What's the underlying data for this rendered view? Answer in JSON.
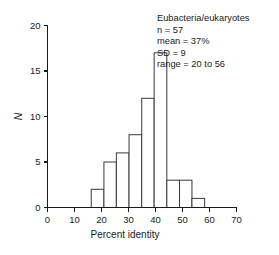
{
  "chart_data": {
    "type": "bar",
    "title": "",
    "subtitle": "",
    "xlabel": "Percent identity",
    "ylabel": "N",
    "xlim": [
      0,
      70
    ],
    "ylim": [
      0,
      20
    ],
    "xticks": [
      0,
      10,
      20,
      30,
      40,
      50,
      60,
      70
    ],
    "yticks": [
      0,
      5,
      10,
      15,
      20
    ],
    "grid": false,
    "legend": null,
    "bin_edges": [
      16.2,
      20.9,
      25.5,
      30.2,
      34.9,
      39.5,
      44.2,
      48.9,
      53.5,
      58.2
    ],
    "bin_width": 4.67,
    "categories": [
      "16-21",
      "21-26",
      "26-30",
      "30-35",
      "35-40",
      "40-44",
      "44-49",
      "49-54",
      "54-58"
    ],
    "values": [
      2,
      5,
      6,
      8,
      12,
      17,
      3,
      3,
      1
    ],
    "bar_style": {
      "fill": "#ffffff",
      "edge": "#3a3a3a"
    },
    "annotations": [
      "Eubacteria/eukaryotes",
      "n = 57",
      "mean = 37%",
      "SD = 9",
      "range = 20 to 56"
    ]
  },
  "annotation": {
    "line1": "Eubacteria/eukaryotes",
    "line2": "n = 57",
    "line3": "mean = 37%",
    "line4": "SD = 9",
    "line5": "range = 20 to 56"
  },
  "axes": {
    "x_label": "Percent identity",
    "y_label": "N",
    "x_tick_labels": [
      "0",
      "10",
      "20",
      "30",
      "40",
      "50",
      "60",
      "70"
    ],
    "y_tick_labels": [
      "0",
      "5",
      "10",
      "15",
      "20"
    ]
  }
}
